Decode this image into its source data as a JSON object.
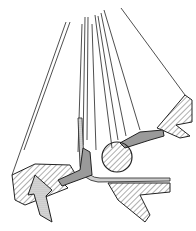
{
  "figure": {
    "colors": {
      "background": "#ffffff",
      "line": "#222222",
      "fill_gray": "#9a9a9a",
      "arrow_fill": "#d0d0d0"
    }
  }
}
